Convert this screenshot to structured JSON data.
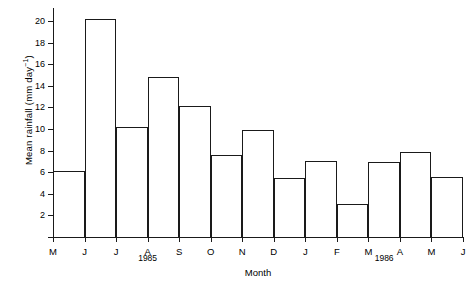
{
  "chart_data": {
    "type": "bar",
    "title": "",
    "xlabel": "Month",
    "ylabel": "Mean rainfall (mm day⁻¹)",
    "ylabel_main": "Mean rainfall (mm day",
    "ylabel_sup": "−1",
    "ylabel_tail": ")",
    "categories": [
      "M",
      "J",
      "J",
      "A",
      "S",
      "O",
      "N",
      "D",
      "J",
      "F",
      "M",
      "A",
      "M"
    ],
    "tick_labels": [
      "M",
      "J",
      "J",
      "A",
      "S",
      "O",
      "N",
      "D",
      "J",
      "F",
      "M",
      "A",
      "M",
      "J"
    ],
    "values": [
      6.1,
      20.2,
      10.2,
      14.8,
      12.1,
      7.6,
      9.9,
      5.5,
      7.0,
      3.1,
      6.9,
      7.9,
      5.6
    ],
    "ylim": [
      0,
      21.2
    ],
    "yticks": [
      2,
      4,
      6,
      8,
      10,
      12,
      14,
      16,
      18,
      20
    ],
    "ytick_labels": [
      "2",
      "4",
      "6",
      "8",
      "10",
      "12",
      "14",
      "16",
      "18",
      "20"
    ],
    "grid": false,
    "legend": "none",
    "annotations": [
      {
        "text": "1985",
        "at_tick": 3.0
      },
      {
        "text": "1986",
        "at_tick": 10.5
      }
    ],
    "bar_fill": "#ffffff",
    "bar_edge": "#1a1a1a",
    "axis_color": "#1a1a1a",
    "background": "#ffffff"
  }
}
